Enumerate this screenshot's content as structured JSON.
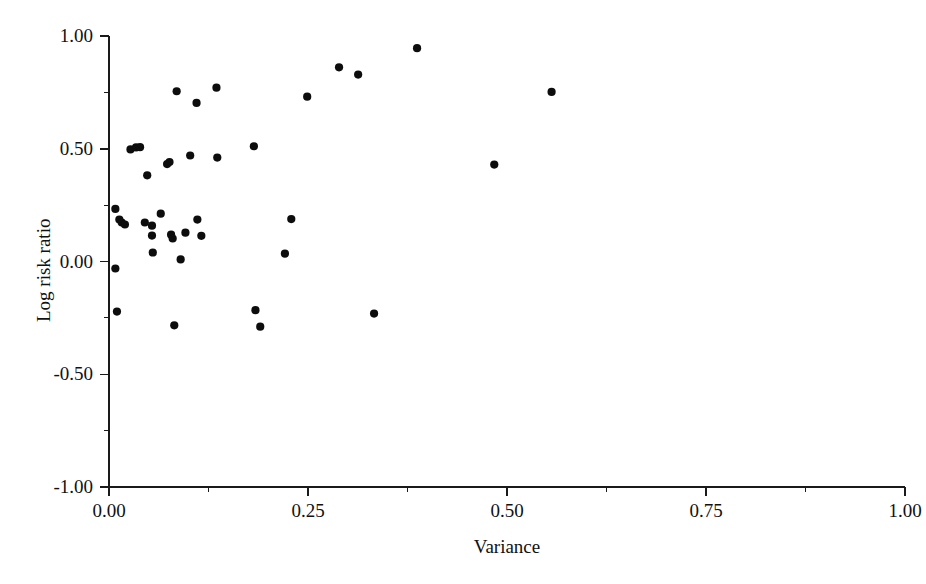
{
  "chart_data": {
    "type": "scatter",
    "title": "",
    "xlabel": "Variance",
    "ylabel": "Log risk ratio",
    "xlim": [
      0.0,
      1.0
    ],
    "ylim": [
      -1.0,
      1.0
    ],
    "grid": false,
    "legend": null,
    "x_major_ticks": [
      0.0,
      0.25,
      0.5,
      0.75,
      1.0
    ],
    "x_major_tick_labels": [
      "0.00",
      "0.25",
      "0.50",
      "0.75",
      "1.00"
    ],
    "x_minor_ticks": [
      0.125,
      0.375,
      0.625,
      0.875
    ],
    "y_major_ticks": [
      -1.0,
      -0.5,
      0.0,
      0.5,
      1.0
    ],
    "y_major_tick_labels": [
      "-1.00",
      "-0.50",
      "0.00",
      "0.50",
      "1.00"
    ],
    "y_minor_ticks": [
      -0.75,
      -0.25,
      0.25,
      0.75
    ],
    "marker": "filled-circle",
    "marker_color": "#0d0d0d",
    "marker_size_px": 5,
    "n_points": 40,
    "points": [
      {
        "x": 0.008,
        "y": 0.233
      },
      {
        "x": 0.008,
        "y": -0.031
      },
      {
        "x": 0.01,
        "y": -0.222
      },
      {
        "x": 0.013,
        "y": 0.186
      },
      {
        "x": 0.016,
        "y": 0.173
      },
      {
        "x": 0.02,
        "y": 0.164
      },
      {
        "x": 0.027,
        "y": 0.497
      },
      {
        "x": 0.034,
        "y": 0.506
      },
      {
        "x": 0.039,
        "y": 0.507
      },
      {
        "x": 0.045,
        "y": 0.173
      },
      {
        "x": 0.048,
        "y": 0.382
      },
      {
        "x": 0.054,
        "y": 0.159
      },
      {
        "x": 0.054,
        "y": 0.115
      },
      {
        "x": 0.055,
        "y": 0.04
      },
      {
        "x": 0.065,
        "y": 0.212
      },
      {
        "x": 0.073,
        "y": 0.432
      },
      {
        "x": 0.076,
        "y": 0.441
      },
      {
        "x": 0.078,
        "y": 0.119
      },
      {
        "x": 0.08,
        "y": 0.102
      },
      {
        "x": 0.082,
        "y": -0.283
      },
      {
        "x": 0.085,
        "y": 0.755
      },
      {
        "x": 0.09,
        "y": 0.009
      },
      {
        "x": 0.096,
        "y": 0.128
      },
      {
        "x": 0.102,
        "y": 0.47
      },
      {
        "x": 0.11,
        "y": 0.703
      },
      {
        "x": 0.111,
        "y": 0.186
      },
      {
        "x": 0.116,
        "y": 0.114
      },
      {
        "x": 0.135,
        "y": 0.771
      },
      {
        "x": 0.136,
        "y": 0.461
      },
      {
        "x": 0.182,
        "y": 0.511
      },
      {
        "x": 0.184,
        "y": -0.216
      },
      {
        "x": 0.19,
        "y": -0.289
      },
      {
        "x": 0.221,
        "y": 0.035
      },
      {
        "x": 0.229,
        "y": 0.188
      },
      {
        "x": 0.249,
        "y": 0.731
      },
      {
        "x": 0.289,
        "y": 0.861
      },
      {
        "x": 0.313,
        "y": 0.829
      },
      {
        "x": 0.333,
        "y": -0.231
      },
      {
        "x": 0.387,
        "y": 0.946
      },
      {
        "x": 0.484,
        "y": 0.43
      },
      {
        "x": 0.556,
        "y": 0.752
      }
    ]
  }
}
